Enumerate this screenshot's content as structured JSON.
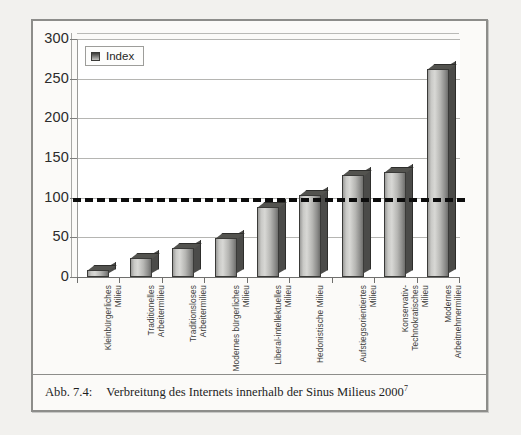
{
  "figure": {
    "caption_number": "Abb. 7.4:",
    "caption_text": "Verbreitung des Internets innerhalb der Sinus Milieus 2000",
    "caption_footnote": "7"
  },
  "legend": {
    "label": "Index",
    "swatch_icon": "legend-swatch-icon"
  },
  "colors": {
    "bar_front_light": "#d8d8d5",
    "bar_front_dark": "#6e6e6c",
    "bar_side": "#4b4b49",
    "bar_top": "#53534f",
    "reference_line": "#0d0d0d",
    "gridline": "#b5b5b2",
    "frame": "#8d8d8a",
    "page_background": "#f2f1ee",
    "plot_background": "#ffffff"
  },
  "chart_data": {
    "type": "bar",
    "title": "",
    "xlabel": "",
    "ylabel": "",
    "ylim": [
      0,
      300
    ],
    "yticks": [
      0,
      50,
      100,
      150,
      200,
      250,
      300
    ],
    "grid": true,
    "legend_position": "top-left",
    "reference_line": {
      "value": 100,
      "style": "dashed",
      "label": ""
    },
    "categories": [
      "Kleinbürgerliches Milieu",
      "Traditionelles\nArbeitermilieu",
      "Traditionsloses\nArbeitermilieu",
      "Modernes bürgerliches\nMilieu",
      "Liberal-intellektuelles\nMilieu",
      "Hedonistische Milieu",
      "Aufstiegsorientiertes\nMilieu",
      "Konservativ-\nTechnokratisches Milieu",
      "Modernes\nArbeitnehmermilieu"
    ],
    "series": [
      {
        "name": "Index",
        "values": [
          9,
          24,
          36,
          49,
          88,
          104,
          128,
          133,
          262
        ]
      }
    ]
  }
}
